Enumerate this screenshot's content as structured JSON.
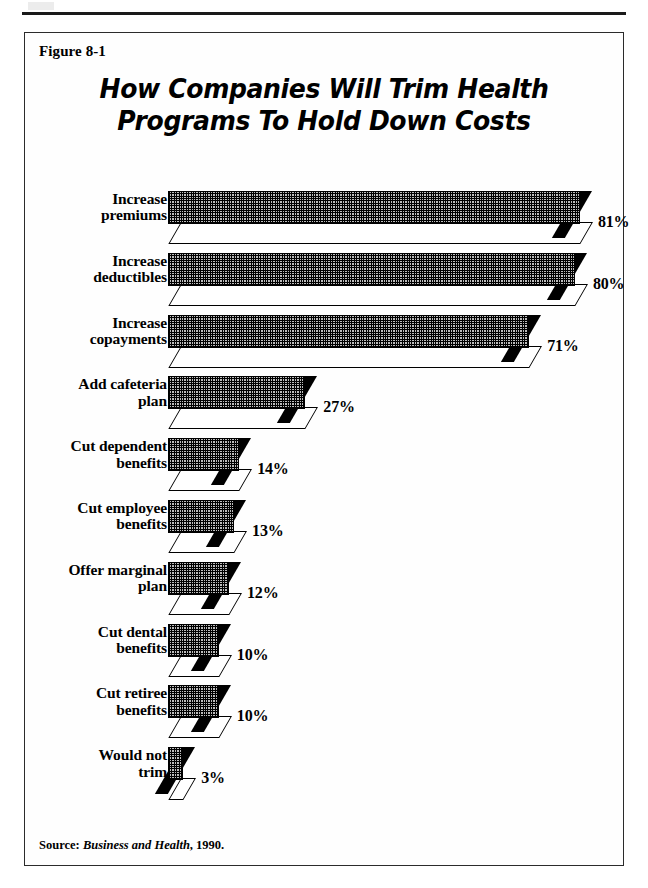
{
  "page": {
    "header_rule": "horizontal-rule"
  },
  "figure": {
    "label": "Figure 8-1",
    "title_line1": "How Companies Will Trim Health",
    "title_line2": "Programs To Hold Down Costs",
    "source_prefix": "Source:",
    "source_publication": "Business and Health",
    "source_suffix": ", 1990."
  },
  "chart_data": {
    "type": "bar",
    "orientation": "horizontal",
    "title": "How Companies Will Trim Health Programs To Hold Down Costs",
    "xlabel": "",
    "ylabel": "",
    "xlim": [
      0,
      81
    ],
    "grid": false,
    "legend": false,
    "value_suffix": "%",
    "categories": [
      "Increase premiums",
      "Increase deductibles",
      "Increase copayments",
      "Add cafeteria plan",
      "Cut dependent benefits",
      "Cut employee benefits",
      "Offer marginal plan",
      "Cut dental benefits",
      "Cut retiree benefits",
      "Would not trim"
    ],
    "values": [
      81,
      80,
      71,
      27,
      14,
      13,
      12,
      10,
      10,
      3
    ],
    "bars": [
      {
        "line1": "Increase",
        "line2": "premiums",
        "value": 81,
        "value_label": "81%"
      },
      {
        "line1": "Increase",
        "line2": "deductibles",
        "value": 80,
        "value_label": "80%"
      },
      {
        "line1": "Increase",
        "line2": "copayments",
        "value": 71,
        "value_label": "71%"
      },
      {
        "line1": "Add cafeteria",
        "line2": "plan",
        "value": 27,
        "value_label": "27%"
      },
      {
        "line1": "Cut dependent",
        "line2": "benefits",
        "value": 14,
        "value_label": "14%"
      },
      {
        "line1": "Cut employee",
        "line2": "benefits",
        "value": 13,
        "value_label": "13%"
      },
      {
        "line1": "Offer marginal",
        "line2": "plan",
        "value": 12,
        "value_label": "12%"
      },
      {
        "line1": "Cut dental",
        "line2": "benefits",
        "value": 10,
        "value_label": "10%"
      },
      {
        "line1": "Cut retiree",
        "line2": "benefits",
        "value": 10,
        "value_label": "10%"
      },
      {
        "line1": "Would not",
        "line2": "trim",
        "value": 3,
        "value_label": "3%"
      }
    ]
  },
  "colors": {
    "ink": "#000000",
    "paper": "#ffffff",
    "bar_fill": "#bdbdbd",
    "frame": "#2b2b2b"
  }
}
